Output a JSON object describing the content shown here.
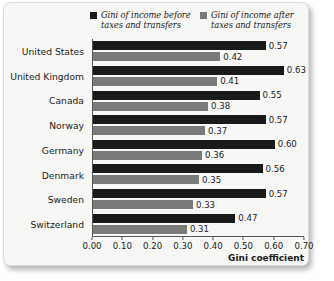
{
  "legend": [
    {
      "label": "Gini of income before taxes and transfers",
      "color": "#1a1a1a",
      "swatch_name": "legend-swatch-before"
    },
    {
      "label": "Gini of income after taxes and transfers",
      "color": "#7a7a7a",
      "swatch_name": "legend-swatch-after"
    }
  ],
  "axis": {
    "x_title": "Gini coefficient",
    "x_ticks": [
      "0.00",
      "0.10",
      "0.20",
      "0.30",
      "0.40",
      "0.50",
      "0.60",
      "0.70"
    ]
  },
  "chart_data": {
    "type": "bar",
    "orientation": "horizontal",
    "title": "",
    "xlabel": "Gini coefficient",
    "ylabel": "",
    "xlim": [
      0.0,
      0.7
    ],
    "grid": false,
    "legend_position": "top",
    "categories": [
      "United States",
      "United Kingdom",
      "Canada",
      "Norway",
      "Germany",
      "Denmark",
      "Sweden",
      "Switzerland"
    ],
    "series": [
      {
        "name": "Gini of income before taxes and transfers",
        "color": "#1a1a1a",
        "values": [
          0.57,
          0.63,
          0.55,
          0.57,
          0.6,
          0.56,
          0.57,
          0.47
        ],
        "labels": [
          "0.57",
          "0.63",
          "0.55",
          "0.57",
          "0.60",
          "0.56",
          "0.57",
          "0.47"
        ]
      },
      {
        "name": "Gini of income after taxes and transfers",
        "color": "#7a7a7a",
        "values": [
          0.42,
          0.41,
          0.38,
          0.37,
          0.36,
          0.35,
          0.33,
          0.31
        ],
        "labels": [
          "0.42",
          "0.41",
          "0.38",
          "0.37",
          "0.36",
          "0.35",
          "0.33",
          "0.31"
        ]
      }
    ]
  }
}
